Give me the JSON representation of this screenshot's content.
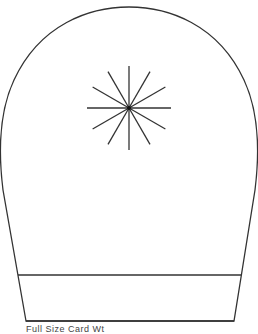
{
  "diagram": {
    "stroke_color": "#333333",
    "background": "#ffffff",
    "star": {
      "rays": 12
    },
    "caption": "Full Size Card Wt"
  }
}
